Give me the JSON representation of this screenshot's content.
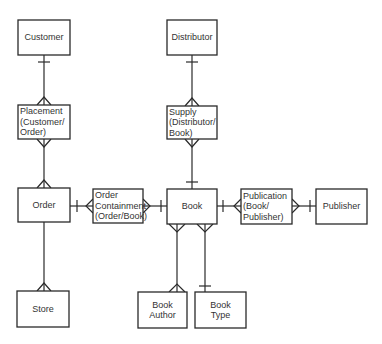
{
  "diagram": {
    "type": "entity-relationship",
    "entities": [
      {
        "id": "customer",
        "lines": [
          "Customer"
        ],
        "x": 18,
        "y": 20,
        "w": 52,
        "h": 35,
        "align": "center"
      },
      {
        "id": "placement",
        "lines": [
          "Placement",
          "(Customer/",
          "Order)"
        ],
        "x": 18,
        "y": 105,
        "w": 52,
        "h": 34,
        "align": "left"
      },
      {
        "id": "order",
        "lines": [
          "Order"
        ],
        "x": 18,
        "y": 188,
        "w": 52,
        "h": 34,
        "align": "center"
      },
      {
        "id": "store",
        "lines": [
          "Store"
        ],
        "x": 17,
        "y": 291,
        "w": 52,
        "h": 36,
        "align": "center"
      },
      {
        "id": "distributor",
        "lines": [
          "Distributor"
        ],
        "x": 167,
        "y": 20,
        "w": 50,
        "h": 35,
        "align": "center"
      },
      {
        "id": "supply",
        "lines": [
          "Supply",
          "(Distributor/",
          "Book)"
        ],
        "x": 167,
        "y": 106,
        "w": 50,
        "h": 33,
        "align": "left"
      },
      {
        "id": "order_containment",
        "lines": [
          "Order",
          "Containment",
          "(Order/Book)"
        ],
        "x": 93,
        "y": 189,
        "w": 50,
        "h": 34,
        "align": "left"
      },
      {
        "id": "book",
        "lines": [
          "Book"
        ],
        "x": 167,
        "y": 189,
        "w": 50,
        "h": 35,
        "align": "center"
      },
      {
        "id": "publication",
        "lines": [
          "Publication",
          "(Book/",
          "Publisher)"
        ],
        "x": 241,
        "y": 189,
        "w": 51,
        "h": 35,
        "align": "left"
      },
      {
        "id": "publisher",
        "lines": [
          "Publisher"
        ],
        "x": 316,
        "y": 189,
        "w": 51,
        "h": 35,
        "align": "center"
      },
      {
        "id": "book_author",
        "lines": [
          "Book",
          "Author"
        ],
        "x": 138,
        "y": 292,
        "w": 49,
        "h": 36,
        "align": "center"
      },
      {
        "id": "book_type",
        "lines": [
          "Book",
          "Type"
        ],
        "x": 195,
        "y": 292,
        "w": 51,
        "h": 36,
        "align": "center"
      }
    ],
    "relationships": [
      {
        "from": "customer",
        "to": "placement",
        "from_end": "one",
        "to_end": "many"
      },
      {
        "from": "placement",
        "to": "order",
        "from_end": "many",
        "to_end": "many"
      },
      {
        "from": "order",
        "to": "store",
        "from_end": "none",
        "to_end": "many"
      },
      {
        "from": "distributor",
        "to": "supply",
        "from_end": "one",
        "to_end": "many"
      },
      {
        "from": "supply",
        "to": "book",
        "from_end": "many",
        "to_end": "one"
      },
      {
        "from": "order",
        "to": "order_containment",
        "from_end": "one",
        "to_end": "many"
      },
      {
        "from": "order_containment",
        "to": "book",
        "from_end": "many",
        "to_end": "one"
      },
      {
        "from": "book",
        "to": "publication",
        "from_end": "one",
        "to_end": "many"
      },
      {
        "from": "publication",
        "to": "publisher",
        "from_end": "many",
        "to_end": "one"
      },
      {
        "from": "book",
        "to": "book_author",
        "from_end": "many",
        "to_end": "many"
      },
      {
        "from": "book",
        "to": "book_type",
        "from_end": "many",
        "to_end": "one"
      }
    ]
  }
}
